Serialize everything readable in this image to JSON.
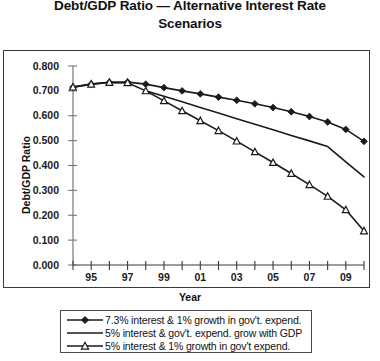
{
  "title": {
    "line1": "Debt/GDP Ratio — Alternative Interest Rate",
    "line2": "Scenarios"
  },
  "axes": {
    "ylabel": "Debt/GDP Ratio",
    "xlabel": "Year",
    "ytick_labels": [
      "0.800",
      "0.700",
      "0.600",
      "0.500",
      "0.400",
      "0.300",
      "0.200",
      "0.100",
      "0.000"
    ],
    "xtick_labels": [
      "95",
      "97",
      "99",
      "01",
      "03",
      "05",
      "07",
      "09"
    ]
  },
  "legend": {
    "items": [
      {
        "label": "7.3% interest & 1% growth in gov't. expend.",
        "marker": "diamond-filled-marker"
      },
      {
        "label": "5% interest & gov't. expend. grow with GDP",
        "marker": "plain-line-marker"
      },
      {
        "label": "5% interest & 1% growth in gov't expend.",
        "marker": "triangle-open-marker"
      }
    ]
  },
  "colors": {
    "series": "#1a1a1a",
    "axis": "#555555",
    "frame": "#3a3a3a",
    "background": "#ffffff"
  },
  "chart_data": {
    "type": "line",
    "title": "Debt/GDP Ratio — Alternative Interest Rate Scenarios",
    "xlabel": "Year",
    "ylabel": "Debt/GDP Ratio",
    "ylim": [
      0.0,
      0.8
    ],
    "xlim": [
      1994,
      2010
    ],
    "grid": false,
    "legend_position": "bottom",
    "x": [
      1994,
      1995,
      1996,
      1997,
      1998,
      1999,
      2000,
      2001,
      2002,
      2003,
      2004,
      2005,
      2006,
      2007,
      2008,
      2009,
      2010
    ],
    "xtick_years": [
      1995,
      1997,
      1999,
      2001,
      2003,
      2005,
      2007,
      2009
    ],
    "series": [
      {
        "name": "7.3% interest & 1% growth in gov't. expend.",
        "marker": "diamond-filled",
        "values": [
          0.715,
          0.727,
          0.734,
          0.735,
          0.727,
          0.713,
          0.7,
          0.688,
          0.675,
          0.662,
          0.648,
          0.633,
          0.616,
          0.597,
          0.575,
          0.545,
          0.497
        ]
      },
      {
        "name": "5% interest & gov't. expend. grow with GDP",
        "marker": "none",
        "values": [
          null,
          null,
          null,
          null,
          0.7,
          0.678,
          0.656,
          0.633,
          0.611,
          0.588,
          0.566,
          0.544,
          0.521,
          0.499,
          0.476,
          0.415,
          0.354
        ]
      },
      {
        "name": "5% interest & 1% growth in gov't expend.",
        "marker": "triangle-open",
        "values": [
          0.715,
          0.727,
          0.734,
          0.733,
          0.7,
          0.66,
          0.62,
          0.58,
          0.54,
          0.498,
          0.455,
          0.412,
          0.368,
          0.323,
          0.276,
          0.222,
          0.137
        ]
      }
    ]
  }
}
